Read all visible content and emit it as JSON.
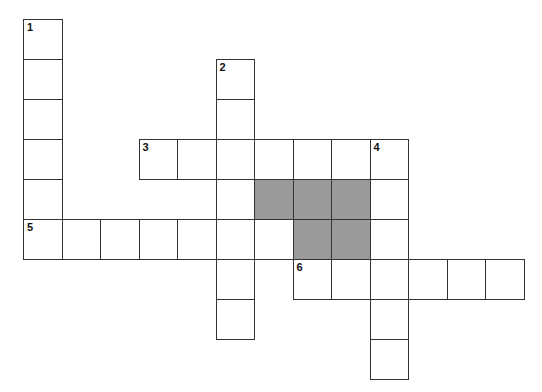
{
  "puzzle": {
    "type": "crossword",
    "origin": {
      "x": 23,
      "y": 19
    },
    "cell_w": 38.5,
    "cell_h": 40,
    "colors": {
      "line": "#333333",
      "shade": "#9a9a9a",
      "background": "#ffffff"
    },
    "words": [
      {
        "number": "1",
        "direction": "down",
        "row": 0,
        "col": 0,
        "length": 6
      },
      {
        "number": "2",
        "direction": "down",
        "row": 1,
        "col": 5,
        "length": 7
      },
      {
        "number": "3",
        "direction": "across",
        "row": 3,
        "col": 3,
        "length": 7
      },
      {
        "number": "4",
        "direction": "down",
        "row": 3,
        "col": 9,
        "length": 6
      },
      {
        "number": "5",
        "direction": "across",
        "row": 5,
        "col": 0,
        "length": 7
      },
      {
        "number": "6",
        "direction": "across",
        "row": 6,
        "col": 7,
        "length": 6
      }
    ],
    "shaded_cells": [
      {
        "row": 4,
        "col": 6
      },
      {
        "row": 4,
        "col": 7
      },
      {
        "row": 4,
        "col": 8
      },
      {
        "row": 5,
        "col": 7
      },
      {
        "row": 5,
        "col": 8
      }
    ]
  }
}
